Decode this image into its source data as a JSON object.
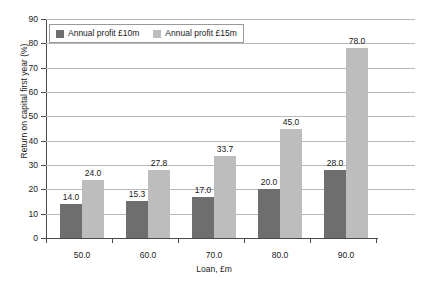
{
  "chart_data": {
    "type": "bar",
    "title": "",
    "xlabel": "Loan, £m",
    "ylabel": "Return on capital first year (%)",
    "categories": [
      "50.0",
      "60.0",
      "70.0",
      "80.0",
      "90.0"
    ],
    "series": [
      {
        "name": "Annual profit £10m",
        "color": "#6e6e6e",
        "values": [
          14.0,
          15.3,
          17.0,
          20.0,
          28.0
        ],
        "labels": [
          "14.0",
          "15.3",
          "17.0",
          "20.0",
          "28.0"
        ]
      },
      {
        "name": "Annual profit £15m",
        "color": "#bdbdbd",
        "values": [
          24.0,
          27.8,
          33.7,
          45.0,
          78.0
        ],
        "labels": [
          "24.0",
          "27.8",
          "33.7",
          "45.0",
          "78.0"
        ]
      }
    ],
    "ylim": [
      0,
      90
    ],
    "yticks": [
      0,
      10,
      20,
      30,
      40,
      50,
      60,
      70,
      80,
      90
    ],
    "ytick_labels": [
      "0",
      "10",
      "20",
      "30",
      "40",
      "50",
      "60",
      "70",
      "80",
      "90"
    ],
    "grid": true,
    "legend_position": "top-left"
  }
}
